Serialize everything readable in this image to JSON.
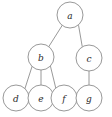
{
  "figure": {
    "kind": "rooted-tree-diagram",
    "width": 112,
    "height": 117,
    "background_color": "#ffffff",
    "stroke_color": "#8d8d8d",
    "label_color": "#2a2a2a",
    "node_fill_color": "#ffffff",
    "node_radius": 13,
    "title": ""
  },
  "nodes": [
    {
      "id": "a",
      "label": "a",
      "cx": 70,
      "cy": 15,
      "r": 13,
      "level": 0
    },
    {
      "id": "b",
      "label": "b",
      "cx": 41,
      "cy": 57,
      "r": 13,
      "level": 1
    },
    {
      "id": "c",
      "label": "c",
      "cx": 89,
      "cy": 58,
      "r": 13,
      "level": 1
    },
    {
      "id": "d",
      "label": "d",
      "cx": 16,
      "cy": 98,
      "r": 13,
      "level": 2
    },
    {
      "id": "e",
      "label": "e",
      "cx": 41,
      "cy": 98,
      "r": 13,
      "level": 2
    },
    {
      "id": "f",
      "label": "f",
      "cx": 64,
      "cy": 98,
      "r": 13,
      "level": 2
    },
    {
      "id": "g",
      "label": "g",
      "cx": 89,
      "cy": 98,
      "r": 13,
      "level": 2
    }
  ],
  "edges": [
    {
      "id": "a-b",
      "from": "a",
      "to": "b",
      "x1": 62.2,
      "y1": 25.4,
      "x2": 48.8,
      "y2": 46.6
    },
    {
      "id": "a-c",
      "from": "a",
      "to": "c",
      "x1": 78.6,
      "y1": 25.6,
      "x2": 82.2,
      "y2": 46.4
    },
    {
      "id": "b-d",
      "from": "b",
      "to": "d",
      "x1": 32.1,
      "y1": 66.3,
      "x2": 24.9,
      "y2": 88.7
    },
    {
      "id": "b-e",
      "from": "b",
      "to": "e",
      "x1": 41.0,
      "y1": 70.0,
      "x2": 41.0,
      "y2": 85.0
    },
    {
      "id": "b-f",
      "from": "b",
      "to": "f",
      "x1": 50.4,
      "y1": 66.0,
      "x2": 56.0,
      "y2": 89.0
    },
    {
      "id": "c-g",
      "from": "c",
      "to": "g",
      "x1": 89.0,
      "y1": 71.0,
      "x2": 89.0,
      "y2": 85.0
    }
  ]
}
